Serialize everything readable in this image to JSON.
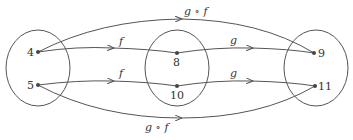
{
  "sets": [
    {
      "name": "domain",
      "elements": [
        "4",
        "5"
      ]
    },
    {
      "name": "middle",
      "elements": [
        "8",
        "10"
      ]
    },
    {
      "name": "codomain",
      "elements": [
        "9",
        "11"
      ]
    }
  ],
  "labels": {
    "e4": "4",
    "e5": "5",
    "e8": "8",
    "e10": "10",
    "e9": "9",
    "e11": "11",
    "f_top": "f",
    "f_bottom": "f",
    "g_top": "g",
    "g_bottom": "g",
    "gf_top": "g ∘ f",
    "gf_bottom": "g ∘ f"
  },
  "mappings": [
    {
      "from": "4",
      "to": "8",
      "label": "f"
    },
    {
      "from": "5",
      "to": "10",
      "label": "f"
    },
    {
      "from": "8",
      "to": "9",
      "label": "g"
    },
    {
      "from": "10",
      "to": "11",
      "label": "g"
    },
    {
      "from": "4",
      "to": "9",
      "label": "g ∘ f"
    },
    {
      "from": "5",
      "to": "11",
      "label": "g ∘ f"
    }
  ]
}
